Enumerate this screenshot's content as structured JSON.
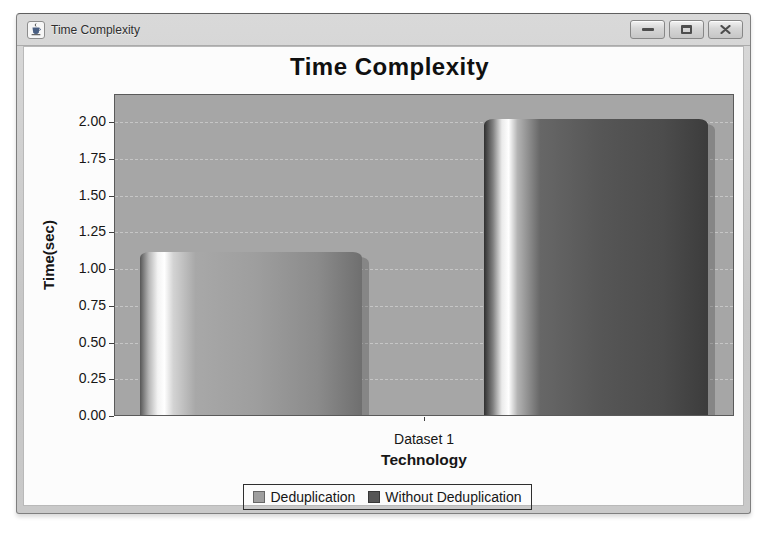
{
  "window": {
    "title": "Time Complexity",
    "icon": "java-coffee-cup-icon",
    "controls": [
      {
        "id": "minimize",
        "label": "Minimize"
      },
      {
        "id": "maximize",
        "label": "Maximize"
      },
      {
        "id": "close",
        "label": "Close"
      }
    ]
  },
  "chart_data": {
    "type": "bar",
    "title": "Time Complexity",
    "xlabel": "Technology",
    "ylabel": "Time(sec)",
    "categories": [
      "Dataset 1"
    ],
    "series": [
      {
        "name": "Deduplication",
        "values": [
          1.12
        ],
        "color": "#9e9e9e"
      },
      {
        "name": "Without Deduplication",
        "values": [
          2.03
        ],
        "color": "#565656"
      }
    ],
    "ylim": [
      0,
      2.19
    ],
    "yticks": [
      "0.00",
      "0.25",
      "0.50",
      "0.75",
      "1.00",
      "1.25",
      "1.50",
      "1.75",
      "2.00"
    ],
    "grid": "horizontal-dashed",
    "legend_position": "bottom",
    "plot_background": "#a6a6a6",
    "gridline_color": "#c6c6c6",
    "bar_style": "cylinder-gradient"
  }
}
